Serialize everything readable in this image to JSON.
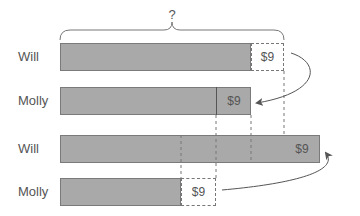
{
  "diagram": {
    "question_mark": "?",
    "rows": [
      {
        "name": "Will",
        "segment_label": "$9"
      },
      {
        "name": "Molly",
        "segment_label": "$9"
      },
      {
        "name": "Will",
        "segment_label": "$9"
      },
      {
        "name": "Molly",
        "segment_label": "$9"
      }
    ],
    "colors": {
      "bar_fill": "#a9a9a9",
      "bar_border": "#7a7a7a",
      "text": "#555555",
      "lines": "#777777"
    }
  }
}
